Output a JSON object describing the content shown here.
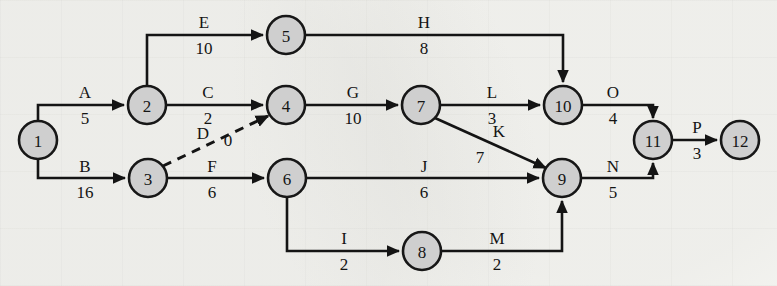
{
  "diagram": {
    "type": "aoa-network",
    "node_fill": "#cfcfcf",
    "node_stroke": "#171717",
    "edge_color": "#141414",
    "background": "#f7f7f4",
    "nodes": [
      {
        "id": "1",
        "label": "1",
        "x": 38,
        "y": 140,
        "r": 19
      },
      {
        "id": "2",
        "label": "2",
        "x": 147,
        "y": 105,
        "r": 19
      },
      {
        "id": "3",
        "label": "3",
        "x": 148,
        "y": 178,
        "r": 19
      },
      {
        "id": "4",
        "label": "4",
        "x": 286,
        "y": 105,
        "r": 19
      },
      {
        "id": "5",
        "label": "5",
        "x": 286,
        "y": 35,
        "r": 19
      },
      {
        "id": "6",
        "label": "6",
        "x": 287,
        "y": 178,
        "r": 19
      },
      {
        "id": "7",
        "label": "7",
        "x": 421,
        "y": 105,
        "r": 19
      },
      {
        "id": "8",
        "label": "8",
        "x": 422,
        "y": 251,
        "r": 19
      },
      {
        "id": "9",
        "label": "9",
        "x": 562,
        "y": 178,
        "r": 19
      },
      {
        "id": "10",
        "label": "10",
        "x": 563,
        "y": 105,
        "r": 19
      },
      {
        "id": "11",
        "label": "11",
        "x": 653,
        "y": 140,
        "r": 19
      },
      {
        "id": "12",
        "label": "12",
        "x": 740,
        "y": 140,
        "r": 19
      }
    ],
    "edges": [
      {
        "id": "A",
        "name": "A",
        "duration": "5",
        "from": "1",
        "to": "2",
        "style": "solid",
        "name_x": 85,
        "name_y": 92,
        "dur_x": 85,
        "dur_y": 118
      },
      {
        "id": "B",
        "name": "B",
        "duration": "16",
        "from": "1",
        "to": "3",
        "style": "solid",
        "name_x": 85,
        "name_y": 166,
        "dur_x": 85,
        "dur_y": 192
      },
      {
        "id": "C",
        "name": "C",
        "duration": "2",
        "from": "2",
        "to": "4",
        "style": "solid",
        "name_x": 208,
        "name_y": 92,
        "dur_x": 208,
        "dur_y": 118
      },
      {
        "id": "D",
        "name": "D",
        "duration": "0",
        "from": "3",
        "to": "4",
        "style": "dashed",
        "name_x": 203,
        "name_y": 133,
        "dur_x": 228,
        "dur_y": 140
      },
      {
        "id": "E",
        "name": "E",
        "duration": "10",
        "from": "2",
        "to": "5",
        "style": "solid",
        "name_x": 204,
        "name_y": 22,
        "dur_x": 204,
        "dur_y": 48
      },
      {
        "id": "F",
        "name": "F",
        "duration": "6",
        "from": "3",
        "to": "6",
        "style": "solid",
        "name_x": 212,
        "name_y": 166,
        "dur_x": 212,
        "dur_y": 192
      },
      {
        "id": "G",
        "name": "G",
        "duration": "10",
        "from": "4",
        "to": "7",
        "style": "solid",
        "name_x": 353,
        "name_y": 92,
        "dur_x": 353,
        "dur_y": 118
      },
      {
        "id": "H",
        "name": "H",
        "duration": "8",
        "from": "5",
        "to": "10",
        "style": "solid",
        "name_x": 424,
        "name_y": 22,
        "dur_x": 424,
        "dur_y": 48
      },
      {
        "id": "I",
        "name": "I",
        "duration": "2",
        "from": "6",
        "to": "8",
        "style": "solid",
        "name_x": 344,
        "name_y": 238,
        "dur_x": 344,
        "dur_y": 264
      },
      {
        "id": "J",
        "name": "J",
        "duration": "6",
        "from": "6",
        "to": "9",
        "style": "solid",
        "name_x": 424,
        "name_y": 166,
        "dur_x": 424,
        "dur_y": 192
      },
      {
        "id": "K",
        "name": "K",
        "duration": "7",
        "from": "7",
        "to": "9",
        "style": "solid",
        "name_x": 499,
        "name_y": 131,
        "dur_x": 480,
        "dur_y": 157
      },
      {
        "id": "L",
        "name": "L",
        "duration": "3",
        "from": "7",
        "to": "10",
        "style": "solid",
        "name_x": 492,
        "name_y": 92,
        "dur_x": 492,
        "dur_y": 118
      },
      {
        "id": "M",
        "name": "M",
        "duration": "2",
        "from": "8",
        "to": "9",
        "style": "solid",
        "name_x": 497,
        "name_y": 238,
        "dur_x": 497,
        "dur_y": 264
      },
      {
        "id": "N",
        "name": "N",
        "duration": "5",
        "from": "9",
        "to": "11",
        "style": "solid",
        "name_x": 613,
        "name_y": 166,
        "dur_x": 613,
        "dur_y": 192
      },
      {
        "id": "O",
        "name": "O",
        "duration": "4",
        "from": "10",
        "to": "11",
        "style": "solid",
        "name_x": 613,
        "name_y": 92,
        "dur_x": 613,
        "dur_y": 118
      },
      {
        "id": "P",
        "name": "P",
        "duration": "3",
        "from": "11",
        "to": "12",
        "style": "solid",
        "name_x": 697,
        "name_y": 127,
        "dur_x": 697,
        "dur_y": 153
      }
    ]
  }
}
